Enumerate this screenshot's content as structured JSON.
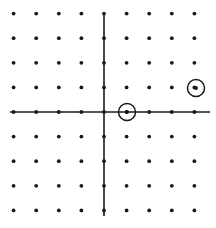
{
  "figure": {
    "width": 216,
    "height": 228,
    "background_color": "#ffffff",
    "ink_color": "#1a1a1a"
  },
  "lattice": {
    "columns": 9,
    "rows": 9,
    "x_index_range": [
      -4,
      4
    ],
    "y_index_range": [
      -4,
      4
    ],
    "origin_px": {
      "x": 104,
      "y": 112
    },
    "spacing_px": {
      "x": 22.6,
      "y": 24.6
    },
    "dot_radius_px": 1.9,
    "dot_color": "#1a1a1a",
    "points": [
      {
        "x": -4,
        "y": 4
      },
      {
        "x": -3,
        "y": 4
      },
      {
        "x": -2,
        "y": 4
      },
      {
        "x": -1,
        "y": 4
      },
      {
        "x": 0,
        "y": 4
      },
      {
        "x": 1,
        "y": 4
      },
      {
        "x": 2,
        "y": 4
      },
      {
        "x": 3,
        "y": 4
      },
      {
        "x": 4,
        "y": 4
      },
      {
        "x": -4,
        "y": 3
      },
      {
        "x": -3,
        "y": 3
      },
      {
        "x": -2,
        "y": 3
      },
      {
        "x": -1,
        "y": 3
      },
      {
        "x": 0,
        "y": 3
      },
      {
        "x": 1,
        "y": 3
      },
      {
        "x": 2,
        "y": 3
      },
      {
        "x": 3,
        "y": 3
      },
      {
        "x": 4,
        "y": 3
      },
      {
        "x": -4,
        "y": 2
      },
      {
        "x": -3,
        "y": 2
      },
      {
        "x": -2,
        "y": 2
      },
      {
        "x": -1,
        "y": 2
      },
      {
        "x": 0,
        "y": 2
      },
      {
        "x": 1,
        "y": 2
      },
      {
        "x": 2,
        "y": 2
      },
      {
        "x": 3,
        "y": 2
      },
      {
        "x": 4,
        "y": 2
      },
      {
        "x": -4,
        "y": 1
      },
      {
        "x": -3,
        "y": 1
      },
      {
        "x": -2,
        "y": 1
      },
      {
        "x": -1,
        "y": 1
      },
      {
        "x": 0,
        "y": 1
      },
      {
        "x": 1,
        "y": 1
      },
      {
        "x": 2,
        "y": 1
      },
      {
        "x": 3,
        "y": 1
      },
      {
        "x": 4,
        "y": 1
      },
      {
        "x": -4,
        "y": 0
      },
      {
        "x": -3,
        "y": 0
      },
      {
        "x": -2,
        "y": 0
      },
      {
        "x": -1,
        "y": 0
      },
      {
        "x": 0,
        "y": 0
      },
      {
        "x": 1,
        "y": 0
      },
      {
        "x": 2,
        "y": 0
      },
      {
        "x": 3,
        "y": 0
      },
      {
        "x": 4,
        "y": 0
      },
      {
        "x": -4,
        "y": -1
      },
      {
        "x": -3,
        "y": -1
      },
      {
        "x": -2,
        "y": -1
      },
      {
        "x": -1,
        "y": -1
      },
      {
        "x": 0,
        "y": -1
      },
      {
        "x": 1,
        "y": -1
      },
      {
        "x": 2,
        "y": -1
      },
      {
        "x": 3,
        "y": -1
      },
      {
        "x": 4,
        "y": -1
      },
      {
        "x": -4,
        "y": -2
      },
      {
        "x": -3,
        "y": -2
      },
      {
        "x": -2,
        "y": -2
      },
      {
        "x": -1,
        "y": -2
      },
      {
        "x": 0,
        "y": -2
      },
      {
        "x": 1,
        "y": -2
      },
      {
        "x": 2,
        "y": -2
      },
      {
        "x": 3,
        "y": -2
      },
      {
        "x": 4,
        "y": -2
      },
      {
        "x": -4,
        "y": -3
      },
      {
        "x": -3,
        "y": -3
      },
      {
        "x": -2,
        "y": -3
      },
      {
        "x": -1,
        "y": -3
      },
      {
        "x": 0,
        "y": -3
      },
      {
        "x": 1,
        "y": -3
      },
      {
        "x": 2,
        "y": -3
      },
      {
        "x": 3,
        "y": -3
      },
      {
        "x": 4,
        "y": -3
      },
      {
        "x": -4,
        "y": -4
      },
      {
        "x": -3,
        "y": -4
      },
      {
        "x": -2,
        "y": -4
      },
      {
        "x": -1,
        "y": -4
      },
      {
        "x": 0,
        "y": -4
      },
      {
        "x": 1,
        "y": -4
      },
      {
        "x": 2,
        "y": -4
      },
      {
        "x": 3,
        "y": -4
      },
      {
        "x": 4,
        "y": -4
      }
    ]
  },
  "axes": {
    "color": "#1a1a1a",
    "stroke_width": 1.6,
    "x_axis": {
      "x1": 10,
      "y1": 112,
      "x2": 210,
      "y2": 112
    },
    "y_axis": {
      "x1": 104,
      "y1": 13,
      "x2": 104,
      "y2": 216
    }
  },
  "highlights": {
    "circle_color": "#1a1a1a",
    "circle_stroke_width": 1.5,
    "circle_radius_px": 8.5,
    "items": [
      {
        "label": "circled-point-1-0",
        "x": 1,
        "y": 0,
        "px": 127,
        "py": 112
      },
      {
        "label": "circled-point-4-1",
        "x": 4,
        "y": 1,
        "px": 196,
        "py": 88
      }
    ]
  }
}
